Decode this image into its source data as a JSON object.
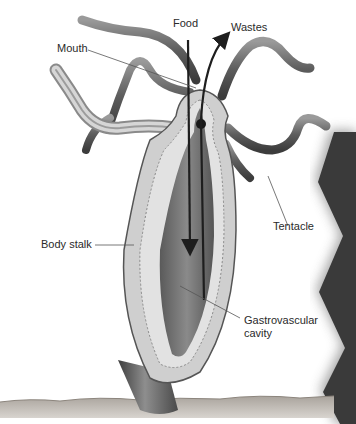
{
  "diagram": {
    "labels": {
      "food": "Food",
      "wastes": "Wastes",
      "mouth": "Mouth",
      "tentacle": "Tentacle",
      "body_stalk": "Body stalk",
      "gastrovascular_line1": "Gastrovascular",
      "gastrovascular_line2": "cavity"
    },
    "colors": {
      "background": "#ffffff",
      "tentacle": "#6e6e6e",
      "body_wall": "#d2d2d2",
      "cavity": "#7a7a7a",
      "arrow": "#1e1e1e",
      "panel": "#3a3a3a",
      "ground": "#bdb9b4"
    }
  }
}
